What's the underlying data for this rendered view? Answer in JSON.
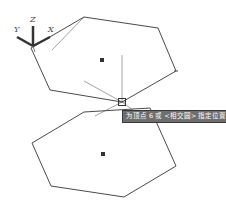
{
  "viewport": {
    "background": "#ffffff",
    "line_color": "#4a4a4a",
    "tracking_color": "#8a8a8a"
  },
  "ucs_icon": {
    "x_label": "X",
    "y_label": "Y",
    "z_label": "Z"
  },
  "upper_hexagon": {
    "points": "84,17 158,28 176,71 122,102 50,90 31,48",
    "center": [
      102,
      60
    ]
  },
  "lower_hexagon": {
    "points": "84,112 150,108 176,166 124,197 51,186 32,143",
    "center": [
      103,
      154
    ]
  },
  "cursor": {
    "x": 122,
    "y": 102
  },
  "tooltip": {
    "text": "为顶点 6 或 <相交圆> 指定位置"
  }
}
